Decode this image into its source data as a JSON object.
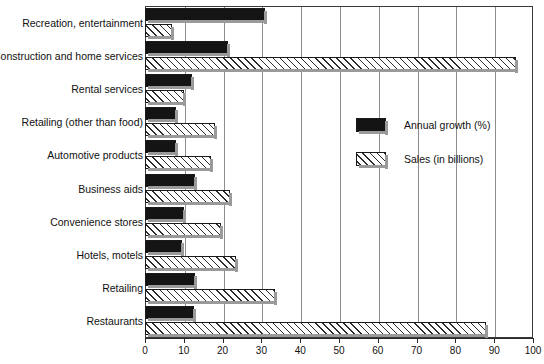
{
  "chart_data": {
    "type": "bar",
    "orientation": "horizontal",
    "title": "",
    "xlabel": "",
    "ylabel": "",
    "xlim": [
      0,
      100
    ],
    "xticks": [
      0,
      10,
      20,
      30,
      40,
      50,
      60,
      70,
      80,
      90,
      100
    ],
    "grid": true,
    "legend_position": "upper-right-inside",
    "categories": [
      "Recreation, entertainment",
      "Construction and home services",
      "Rental services",
      "Retailing (other than food)",
      "Automotive products",
      "Business aids",
      "Convenience stores",
      "Hotels, motels",
      "Retailing",
      "Restaurants"
    ],
    "series": [
      {
        "name": "Annual growth (%)",
        "color": "#141414",
        "pattern": "solid",
        "values": [
          31,
          21.5,
          12,
          8,
          8,
          13,
          10,
          9.5,
          13,
          12.5
        ]
      },
      {
        "name": "Sales (in billions)",
        "color": "#ffffff",
        "pattern": "diagonal-hatch",
        "values": [
          7,
          95.5,
          10,
          18,
          17,
          22,
          19.5,
          23.5,
          33.5,
          88
        ]
      }
    ]
  },
  "legend": {
    "items": [
      {
        "label": "Annual growth (%)",
        "style": "solid-black"
      },
      {
        "label": "Sales (in billions)",
        "style": "hatched"
      }
    ]
  },
  "axis": {
    "tick_labels": [
      "0",
      "10",
      "20",
      "30",
      "40",
      "50",
      "60",
      "70",
      "80",
      "90",
      "100"
    ]
  }
}
